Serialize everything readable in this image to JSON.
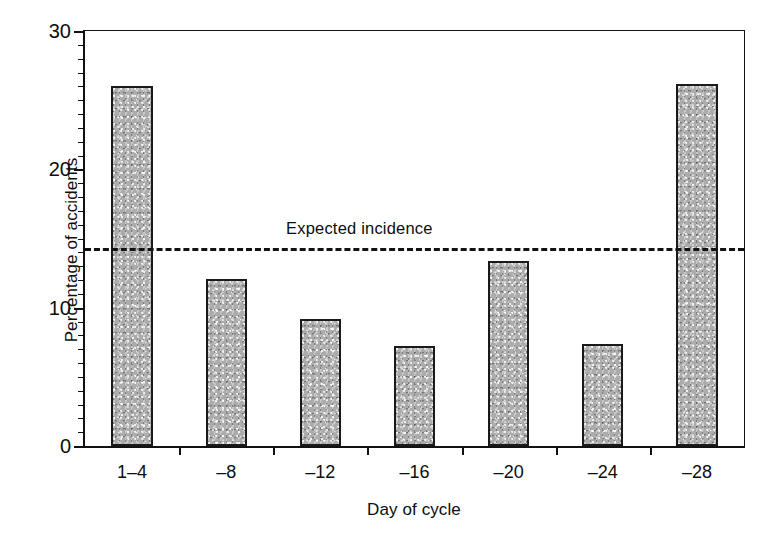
{
  "chart_data": {
    "type": "bar",
    "title": "",
    "xlabel": "Day of cycle",
    "ylabel": "Percentage of accidents",
    "categories": [
      "1–4",
      "–8",
      "–12",
      "–16",
      "–20",
      "–24",
      "–28"
    ],
    "values": [
      26.0,
      12.1,
      9.2,
      7.2,
      13.4,
      7.4,
      26.2
    ],
    "ylim": [
      0,
      30
    ],
    "xlim_note": "categorical, 7 bins of 4 days",
    "ytick_labels": [
      "0",
      "10",
      "20",
      "30"
    ],
    "ytick_values": [
      0,
      10,
      20,
      30
    ],
    "yminor_interval": 1,
    "grid": false,
    "legend": "none",
    "annotations": [
      {
        "name": "expected-incidence",
        "label": "Expected incidence",
        "type": "horizontal-dashed-line",
        "value": 14.3
      }
    ],
    "bar_fill_color": "#b9b9b9",
    "bar_edge_color": "#1a1a1a",
    "axis_color": "#111111",
    "background_color": "#ffffff"
  }
}
